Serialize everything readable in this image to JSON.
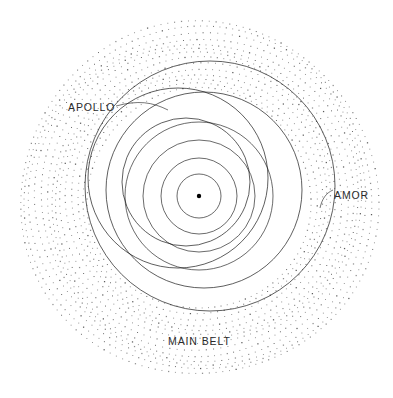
{
  "figure": {
    "title": "",
    "background_color": "#ffffff",
    "width": 393,
    "height": 398
  },
  "labels": {
    "apollo": "APOLLO",
    "amor": "AMOR",
    "main_belt": "MAIN BELT"
  },
  "colors": {
    "orbit_line": "#1a1a1a",
    "belt_dot": "#4a4a4a",
    "sun": "#000000",
    "label_text": "#2b2b2b",
    "background": "#ffffff"
  },
  "chart_data": {
    "type": "scatter",
    "title": "",
    "subtitle": "",
    "xlabel": "",
    "ylabel": "",
    "grid": false,
    "legend_position": "in-plot-annotations",
    "projection": "ecliptic-plane-polar",
    "center_body": {
      "name": "Sun",
      "x": 199,
      "y": 196,
      "radius_px": 2.2,
      "marker": "filled-dot"
    },
    "annotations": [
      {
        "text": "APOLLO",
        "x": 68,
        "y": 108,
        "points_to": "apollo-class-orbit"
      },
      {
        "text": "AMOR",
        "x": 334,
        "y": 196,
        "points_to": "amor-class-orbit"
      },
      {
        "text": "MAIN BELT",
        "x": 168,
        "y": 342,
        "points_to": "main-belt-rings"
      }
    ],
    "series": [
      {
        "name": "Inner planet orbits",
        "style": "solid-circle",
        "note": "Concentric circles centred on the Sun",
        "orbits": [
          {
            "label": "innermost",
            "cx": 199,
            "cy": 196,
            "r": 22
          },
          {
            "label": "second",
            "cx": 199,
            "cy": 196,
            "r": 38
          },
          {
            "label": "third",
            "cx": 199,
            "cy": 196,
            "r": 56
          },
          {
            "label": "fourth",
            "cx": 199,
            "cy": 196,
            "r": 74
          }
        ]
      },
      {
        "name": "Apollo-class asteroid orbit",
        "style": "solid-circle",
        "note": "Eccentric orbit crossing inner planet orbits, aphelion upper-left",
        "orbits": [
          {
            "label": "apollo-class-orbit",
            "cx": 178,
            "cy": 178,
            "r": 90
          },
          {
            "label": "apollo-class-orbit-2",
            "cx": 186,
            "cy": 182,
            "r": 64
          }
        ]
      },
      {
        "name": "Amor-class asteroid orbit",
        "style": "solid-circle",
        "note": "Large eccentric orbit reaching towards the main belt on the right",
        "orbits": [
          {
            "label": "amor-class-orbit",
            "cx": 210,
            "cy": 186,
            "r": 125
          },
          {
            "label": "amor-class-orbit-2",
            "cx": 204,
            "cy": 190,
            "r": 98
          }
        ]
      },
      {
        "name": "Main belt asteroid rings",
        "style": "dotted-circle",
        "note": "Concentric dotted rings representing the main asteroid belt population",
        "ring_count": 14,
        "inner_radius_px": 112,
        "outer_radius_px": 179,
        "cx": 199,
        "cy": 199
      }
    ]
  }
}
